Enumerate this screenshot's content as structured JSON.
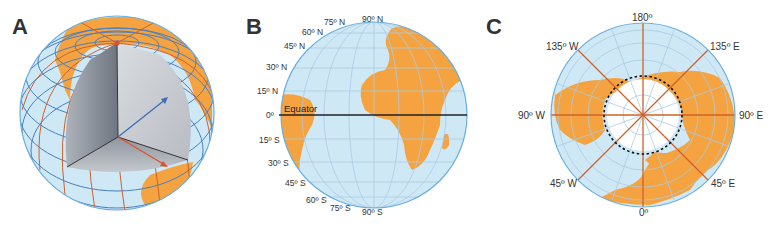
{
  "colors": {
    "ocean": "#cfe8f6",
    "land": "#f5a340",
    "rim": "#6aaedc",
    "grid_blue": "#4a7fbf",
    "grid_red": "#d0602a",
    "equator": "#222222",
    "core_dark": "#7e8590",
    "core_light": "#c9cdd3",
    "arrow_blue": "#3a6fb5",
    "arrow_red": "#e0502a"
  },
  "panels": {
    "a": {
      "letter": "A",
      "description": "Cutaway sphere showing latitude/longitude grid with blue and red radius arrows from Earth's center"
    },
    "b": {
      "letter": "B",
      "equator_label": "Equator",
      "latitude_labels": {
        "n90": "90º N",
        "n75": "75º N",
        "n60": "60º N",
        "n45": "45º N",
        "n30": "30º N",
        "n15": "15º N",
        "zero": "0º",
        "s15": "15º S",
        "s30": "30º S",
        "s45": "45º S",
        "s60": "60º S",
        "s75": "75º S",
        "s90": "90º S"
      }
    },
    "c": {
      "letter": "C",
      "longitude_labels": {
        "l180": "180º",
        "w135": "135º W",
        "e135": "135º E",
        "w90": "90º W",
        "e90": "90º E",
        "w45": "45º W",
        "e45": "45º E",
        "zero": "0º"
      },
      "arctic_circle": "dotted circle"
    }
  }
}
